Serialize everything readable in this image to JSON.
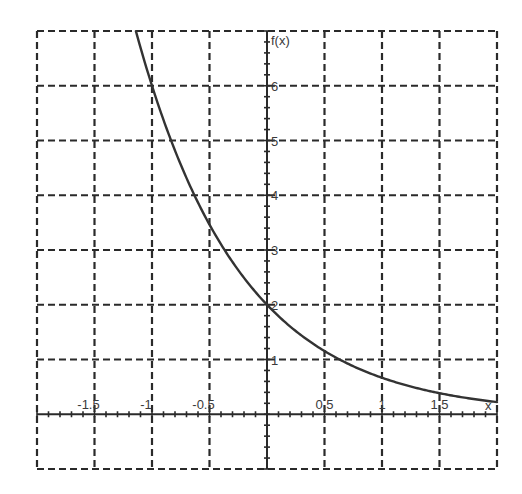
{
  "chart_data": {
    "type": "line",
    "title": "",
    "xlabel": "x",
    "ylabel": "f(x)",
    "xlim": [
      -2,
      2
    ],
    "ylim": [
      -1,
      7
    ],
    "grid": true,
    "grid_style": "dashed",
    "legend": null,
    "x_ticks": [
      -1.5,
      -1,
      -0.5,
      0.5,
      1,
      1.5
    ],
    "x_tick_labels": [
      "-1.5",
      "-1",
      "-0.5",
      "0.5",
      "1",
      "1.5"
    ],
    "y_ticks": [
      1,
      2,
      3,
      4,
      5,
      6
    ],
    "y_tick_labels": [
      "1",
      "2",
      "3",
      "4",
      "5",
      "6"
    ],
    "x_minor_step": 0.1,
    "y_minor_step": 0.2,
    "series": [
      {
        "name": "f(x) = 2·(1/3)^x",
        "x": [
          -1.14,
          -1,
          -0.75,
          -0.5,
          -0.25,
          0,
          0.25,
          0.5,
          0.75,
          1,
          1.25,
          1.5,
          1.75,
          2
        ],
        "values": [
          7.0,
          6.0,
          4.56,
          3.46,
          2.63,
          2.0,
          1.52,
          1.15,
          0.88,
          0.67,
          0.51,
          0.38,
          0.29,
          0.22
        ]
      }
    ]
  },
  "colors": {
    "grid": "#2a2a2a",
    "axis": "#2a2a2a",
    "curve": "#333333",
    "text": "#3a3a3a",
    "background": "#ffffff"
  }
}
